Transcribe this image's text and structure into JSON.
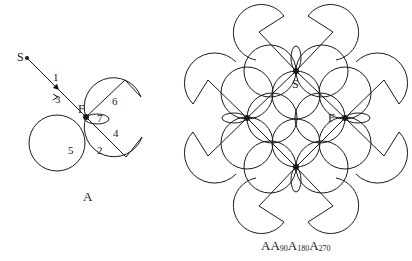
{
  "diagram_a": {
    "caption": "A",
    "nodes": {
      "start": "S",
      "focus": "F"
    },
    "step_labels": [
      "1",
      "2",
      "3",
      "4",
      "5",
      "6",
      "7"
    ]
  },
  "diagram_b": {
    "caption_parts": [
      "A",
      "A",
      "90",
      "A",
      "180",
      "A",
      "270"
    ],
    "nodes": {
      "start": "S",
      "focus": "F"
    }
  },
  "colors": {
    "stroke": "#1a1a1a",
    "background": "#ffffff"
  }
}
